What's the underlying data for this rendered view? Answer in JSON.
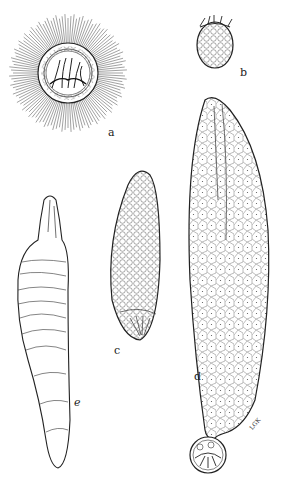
{
  "figure": {
    "labels": {
      "a": "a",
      "b": "b",
      "c": "c",
      "d": "d",
      "e": "e"
    },
    "signature": "LGK",
    "ink_color": "#2a2a2a",
    "background": "#ffffff"
  }
}
